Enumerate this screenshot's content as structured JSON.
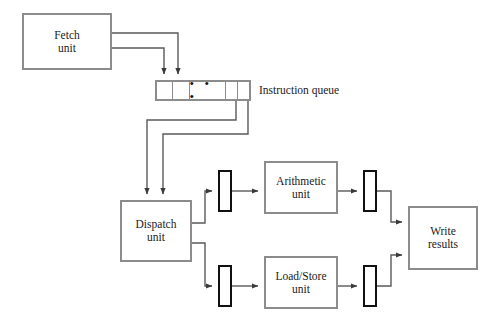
{
  "diagram": {
    "stroke_gray": "#8c8c8c",
    "stroke_black": "#111111",
    "background": "#ffffff"
  },
  "blocks": {
    "fetch_unit": {
      "line1": "Fetch",
      "line2": "unit"
    },
    "dispatch_unit": {
      "line1": "Dispatch",
      "line2": "unit"
    },
    "arithmetic_unit": {
      "line1": "Arithmetic",
      "line2": "unit"
    },
    "load_store_unit": {
      "line1": "Load/Store",
      "line2": "unit"
    },
    "write_results": {
      "line1": "Write",
      "line2": "results"
    }
  },
  "instruction_queue": {
    "label": "Instruction queue",
    "cells": [
      "",
      "",
      "• • •",
      "",
      ""
    ],
    "ellipsis": "• • •"
  },
  "buffers": [
    {
      "name": "arithmetic-input-buffer"
    },
    {
      "name": "arithmetic-output-buffer"
    },
    {
      "name": "load-store-input-buffer"
    },
    {
      "name": "load-store-output-buffer"
    }
  ]
}
